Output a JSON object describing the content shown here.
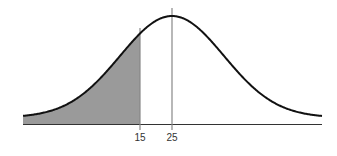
{
  "chart_data": {
    "type": "area",
    "title": "",
    "xlabel": "",
    "ylabel": "",
    "distribution": "normal",
    "mean": 25,
    "shaded_region": {
      "from": "-inf",
      "to": 15
    },
    "reference_lines": [
      15,
      25
    ],
    "tick_labels": [
      "15",
      "25"
    ],
    "grid": false,
    "legend": null
  },
  "colors": {
    "curve": "#111111",
    "shade": "#9a9a9a",
    "axis": "#333333",
    "ref_line": "#888888"
  },
  "labels": {
    "tick_15": "15",
    "tick_25": "25"
  }
}
